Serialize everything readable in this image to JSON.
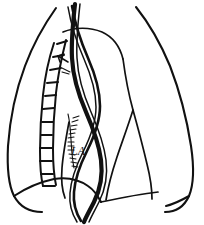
{
  "figure": {
    "title": "Chest line drawing",
    "background_color": "#ffffff",
    "ink_color": "#111111",
    "width": 204,
    "height": 225
  },
  "labels": {
    "left_atrium": "LA"
  },
  "parts": {
    "right_lung": "right-lung-outline",
    "left_lung": "left-lung-outline",
    "vertebral_column": "vertebral-column",
    "descending_aorta": "descending-aorta",
    "esophagus": "esophagus",
    "cardiac_border": "cardiac-border",
    "diaphragm_left": "left-diaphragm-dome",
    "diaphragm_right": "right-diaphragm-dome",
    "aortic_arch": "aortic-arch",
    "hatched_marking": "hatched-marking",
    "pointer": "pointer-line"
  },
  "icons": {
    "pointer": "arrow-pointer-icon"
  }
}
